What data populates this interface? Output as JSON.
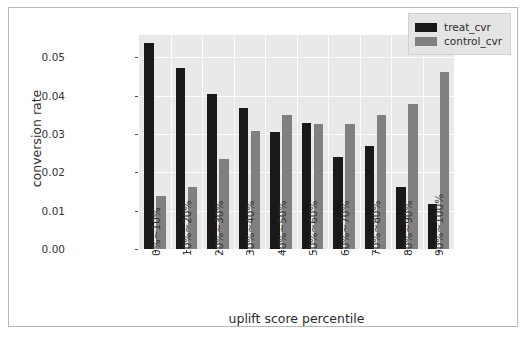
{
  "chart_data": {
    "type": "bar",
    "title": "",
    "xlabel": "uplift score percentile",
    "ylabel": "conversion rate",
    "categories": [
      "0%~10%",
      "10%~20%",
      "20%~30%",
      "30%~40%",
      "40%~50%",
      "50%~60%",
      "60%~70%",
      "70%~80%",
      "80%~90%",
      "90%~100%"
    ],
    "series": [
      {
        "name": "treat_cvr",
        "color": "#191919",
        "values": [
          0.0538,
          0.0471,
          0.0404,
          0.0368,
          0.0306,
          0.0328,
          0.0241,
          0.0269,
          0.0163,
          0.0118
        ]
      },
      {
        "name": "control_cvr",
        "color": "#808080",
        "values": [
          0.0139,
          0.0163,
          0.0236,
          0.0308,
          0.0349,
          0.0325,
          0.0327,
          0.0349,
          0.0377,
          0.0462
        ]
      }
    ],
    "yticks": [
      "0.00",
      "0.01",
      "0.02",
      "0.03",
      "0.04",
      "0.05"
    ],
    "ytick_values": [
      0.0,
      0.01,
      0.02,
      0.03,
      0.04,
      0.05
    ],
    "ylim": [
      0,
      0.0558
    ],
    "grid": true,
    "legend_position": "upper right",
    "plot_background": "#e9e9e9",
    "figure_background": "#ffffff"
  },
  "caption": ""
}
